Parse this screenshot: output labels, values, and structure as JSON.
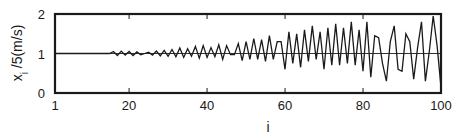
{
  "chart_data": {
    "type": "line",
    "title": "",
    "xlabel": "i",
    "ylabel": "x_i /5(m/s)",
    "ylabel_parts": {
      "main": "x",
      "sub": "i",
      "rest": " /5(m/s)"
    },
    "xlim": [
      1,
      100
    ],
    "ylim": [
      0,
      2
    ],
    "grid": false,
    "legend": null,
    "x_ticks": [
      1,
      20,
      40,
      60,
      80,
      100
    ],
    "x_tick_labels": [
      "1",
      "20",
      "40",
      "60",
      "80",
      "100"
    ],
    "y_ticks": [
      0,
      1,
      2
    ],
    "y_tick_labels": [
      "0",
      "1",
      "2"
    ],
    "reference_line": 1,
    "series": [
      {
        "name": "x_i/5",
        "x": [
          1,
          2,
          3,
          4,
          5,
          6,
          7,
          8,
          9,
          10,
          11,
          12,
          13,
          14,
          15,
          16,
          17,
          18,
          19,
          20,
          21,
          22,
          23,
          24,
          25,
          26,
          27,
          28,
          29,
          30,
          31,
          32,
          33,
          34,
          35,
          36,
          37,
          38,
          39,
          40,
          41,
          42,
          43,
          44,
          45,
          46,
          47,
          48,
          49,
          50,
          51,
          52,
          53,
          54,
          55,
          56,
          57,
          58,
          59,
          60,
          61,
          62,
          63,
          64,
          65,
          66,
          67,
          68,
          69,
          70,
          71,
          72,
          73,
          74,
          75,
          76,
          77,
          78,
          79,
          80,
          81,
          82,
          83,
          84,
          85,
          86,
          87,
          88,
          89,
          90,
          91,
          92,
          93,
          94,
          95,
          96,
          97,
          98,
          99,
          100
        ],
        "values": [
          1.0,
          1.0,
          1.0,
          1.0,
          1.0,
          1.0,
          1.0,
          1.0,
          1.0,
          1.0,
          1.0,
          1.0,
          1.0,
          1.0,
          1.0,
          1.05,
          0.95,
          1.06,
          0.96,
          1.05,
          0.95,
          1.04,
          0.97,
          1.0,
          1.03,
          0.96,
          1.06,
          0.94,
          1.08,
          0.93,
          1.1,
          0.92,
          1.14,
          0.9,
          1.12,
          0.93,
          1.18,
          0.88,
          1.2,
          0.9,
          1.15,
          0.92,
          1.22,
          0.85,
          1.2,
          0.97,
          0.97,
          1.25,
          0.82,
          1.3,
          0.85,
          1.38,
          0.85,
          1.35,
          0.8,
          1.45,
          0.85,
          1.3,
          1.3,
          0.6,
          1.55,
          0.75,
          1.5,
          0.65,
          1.6,
          0.8,
          1.7,
          0.85,
          1.55,
          0.6,
          1.65,
          0.7,
          1.75,
          0.7,
          1.65,
          0.75,
          1.8,
          0.7,
          1.6,
          0.55,
          1.8,
          0.4,
          1.45,
          1.4,
          0.75,
          0.3,
          1.3,
          1.7,
          0.6,
          0.55,
          1.5,
          1.3,
          0.35,
          1.15,
          1.8,
          0.3,
          1.05,
          1.95,
          1.2,
          0.15
        ]
      }
    ]
  }
}
